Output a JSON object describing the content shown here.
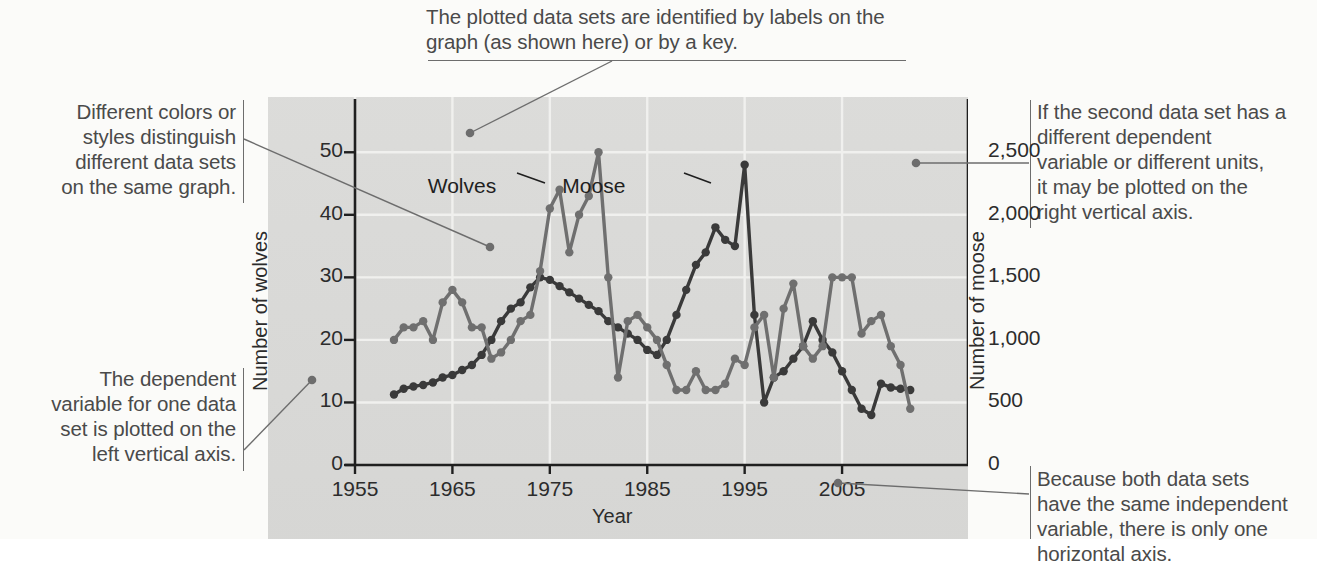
{
  "annotations": {
    "top": "The plotted data sets are identified by labels on the graph (as shown here) or by a key.",
    "top_line1": "The plotted data sets are identified by labels on the",
    "top_line2": "graph (as shown here) or by a key.",
    "left_top_line1": "Different colors or",
    "left_top_line2": "styles distinguish",
    "left_top_line3": "different data sets",
    "left_top_line4": "on the same graph.",
    "left_bottom_line1": "The dependent",
    "left_bottom_line2": "variable for one data",
    "left_bottom_line3": "set is plotted on the",
    "left_bottom_line4": "left vertical axis.",
    "right_top_line1": "If the second data set has a",
    "right_top_line2": "different dependent",
    "right_top_line3": "variable or different units,",
    "right_top_line4": "it may be plotted on the",
    "right_top_line5": "right vertical axis.",
    "right_bottom_line1": "Because both data sets",
    "right_bottom_line2": "have the same independent",
    "right_bottom_line3": "variable, there is only one",
    "right_bottom_line4": "horizontal axis."
  },
  "chart_data": {
    "type": "line",
    "title": "",
    "xlabel": "Year",
    "ylabel": "Number of wolves",
    "y2label": "Number of moose",
    "xlim": [
      1955,
      2013
    ],
    "ylim": [
      0,
      55
    ],
    "y2lim": [
      0,
      2750
    ],
    "xticks": [
      1955,
      1965,
      1975,
      1985,
      1995,
      2005
    ],
    "xticklabels": [
      "1955",
      "1965",
      "1975",
      "1985",
      "1995",
      "2005"
    ],
    "yticks": [
      0,
      10,
      20,
      30,
      40,
      50
    ],
    "yticklabels": [
      "0",
      "10",
      "20",
      "30",
      "40",
      "50"
    ],
    "y2ticks": [
      0,
      500,
      1000,
      1500,
      2000,
      2500
    ],
    "y2ticklabels": [
      "0",
      "500",
      "1,000",
      "1,500",
      "2,000",
      "2,500"
    ],
    "grid": true,
    "legend": "inline-labels",
    "colors": {
      "wolves": "#6f6f6f",
      "moose": "#3a3a3a",
      "plot_bg": "#d8d8d6",
      "grid": "#f0f0ee"
    },
    "series": [
      {
        "name": "Wolves",
        "axis": "left",
        "label_pos": {
          "x": 1971.5,
          "y": 44.5
        },
        "x": [
          1959,
          1960,
          1961,
          1962,
          1963,
          1964,
          1965,
          1966,
          1967,
          1968,
          1969,
          1970,
          1971,
          1972,
          1973,
          1974,
          1975,
          1976,
          1977,
          1978,
          1979,
          1980,
          1981,
          1982,
          1983,
          1984,
          1985,
          1986,
          1987,
          1988,
          1989,
          1990,
          1991,
          1992,
          1993,
          1994,
          1995,
          1996,
          1997,
          1998,
          1999,
          2000,
          2001,
          2002,
          2003,
          2004,
          2005,
          2006,
          2007,
          2008,
          2009,
          2010,
          2011,
          2012
        ],
        "values": [
          20,
          22,
          22,
          23,
          20,
          26,
          28,
          26,
          22,
          22,
          17,
          18,
          20,
          23,
          24,
          31,
          41,
          44,
          34,
          40,
          43,
          50,
          30,
          14,
          23,
          24,
          22,
          20,
          16,
          12,
          12,
          15,
          12,
          12,
          13,
          17,
          16,
          22,
          24,
          14,
          25,
          29,
          19,
          17,
          19,
          30,
          30,
          30,
          21,
          23,
          24,
          19,
          16,
          9
        ]
      },
      {
        "name": "Moose",
        "axis": "right",
        "label_pos": {
          "x": 1984.5,
          "y": 44.5
        },
        "x": [
          1959,
          1960,
          1961,
          1962,
          1963,
          1964,
          1965,
          1966,
          1967,
          1968,
          1969,
          1970,
          1971,
          1972,
          1973,
          1974,
          1975,
          1976,
          1977,
          1978,
          1979,
          1980,
          1981,
          1982,
          1983,
          1984,
          1985,
          1986,
          1987,
          1988,
          1989,
          1990,
          1991,
          1992,
          1993,
          1994,
          1995,
          1996,
          1997,
          1998,
          1999,
          2000,
          2001,
          2002,
          2003,
          2004,
          2005,
          2006,
          2007,
          2008,
          2009,
          2010,
          2011,
          2012
        ],
        "values": [
          563,
          610,
          628,
          640,
          660,
          700,
          720,
          760,
          800,
          880,
          1000,
          1150,
          1250,
          1300,
          1420,
          1500,
          1480,
          1430,
          1380,
          1330,
          1280,
          1230,
          1150,
          1100,
          1050,
          1000,
          920,
          880,
          1000,
          1200,
          1400,
          1600,
          1700,
          1900,
          1800,
          1750,
          2400,
          1200,
          500,
          700,
          750,
          850,
          950,
          1150,
          1000,
          900,
          750,
          600,
          450,
          400,
          650,
          620,
          610,
          600
        ]
      }
    ]
  }
}
